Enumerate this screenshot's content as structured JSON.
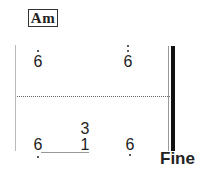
{
  "chord": {
    "label": "Am"
  },
  "upper_voice": [
    {
      "digit": "6",
      "octave_dots_above": 1
    },
    {
      "digit": "6",
      "octave_dots_above": 2
    }
  ],
  "lower_voice": [
    {
      "digit": "6",
      "octave_dots_below": 1
    },
    {
      "digit": "1",
      "stacked_above": "3"
    },
    {
      "digit": "6",
      "octave_dots_below": 1
    }
  ],
  "ending": {
    "label": "Fine"
  }
}
